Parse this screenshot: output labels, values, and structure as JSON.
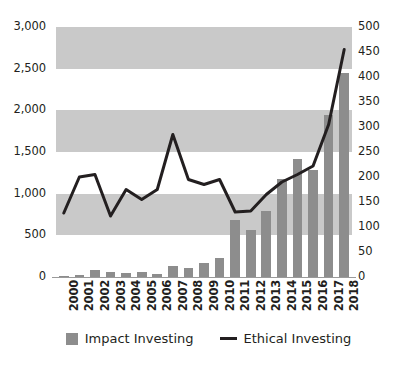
{
  "chart_data": {
    "type": "bar",
    "title": "",
    "subtitle": "",
    "xlabel": "",
    "ylabel": "",
    "categories": [
      "2000",
      "2001",
      "2002",
      "2003",
      "2004",
      "2005",
      "2006",
      "2007",
      "2008",
      "2009",
      "2010",
      "2011",
      "2012",
      "2013",
      "2014",
      "2015",
      "2016",
      "2017",
      "2018"
    ],
    "series": [
      {
        "name": "Impact Investing",
        "type": "bar",
        "axis": "left",
        "color": "#8d8d8d",
        "values": [
          10,
          20,
          90,
          55,
          50,
          55,
          35,
          130,
          110,
          170,
          230,
          680,
          570,
          790,
          1180,
          1420,
          1280,
          1950,
          2450
        ]
      },
      {
        "name": "Ethical Investing",
        "type": "line",
        "axis": "right",
        "color": "#231f20",
        "values": [
          128,
          200,
          205,
          122,
          175,
          155,
          175,
          285,
          195,
          185,
          195,
          130,
          132,
          165,
          190,
          205,
          222,
          305,
          455
        ]
      }
    ],
    "left_axis": {
      "min": 0,
      "max": 3000,
      "step": 500,
      "ticks": [
        "0",
        "500",
        "1,000",
        "1,500",
        "2,000",
        "2,500",
        "3,000"
      ]
    },
    "right_axis": {
      "min": 0,
      "max": 500,
      "step": 50,
      "ticks": [
        "0",
        "50",
        "100",
        "150",
        "200",
        "250",
        "300",
        "350",
        "400",
        "450",
        "500"
      ]
    },
    "grid": {
      "banded": true,
      "band_color": "#c9c9c9",
      "alt_band_color": "#ffffff"
    },
    "legend": {
      "position": "bottom",
      "entries": [
        {
          "label": "Impact Investing",
          "marker": "square",
          "color": "#8d8d8d"
        },
        {
          "label": "Ethical Investing",
          "marker": "line",
          "color": "#231f20"
        }
      ]
    }
  }
}
